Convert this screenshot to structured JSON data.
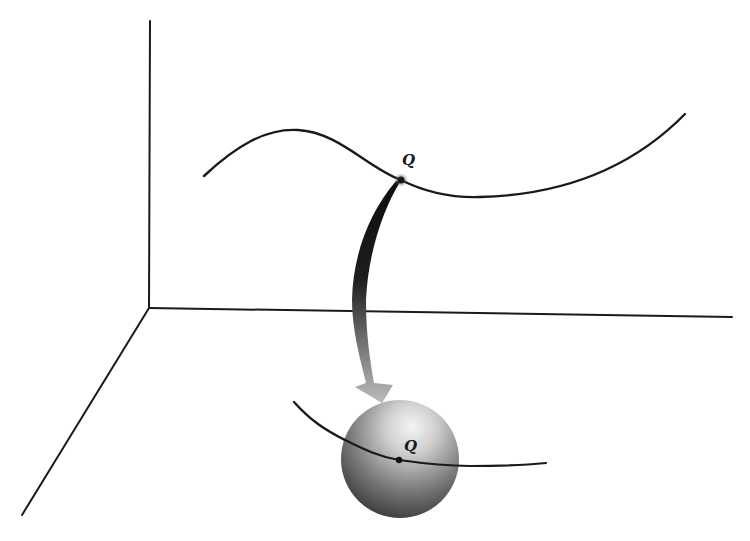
{
  "figure": {
    "type": "diagram",
    "colors": {
      "background": "#ffffff",
      "stroke": "#1a1a1a",
      "sphere_highlight": "#f2f2f2",
      "sphere_shadow": "#3a3a3a",
      "arrow_top": "#0d0d0d",
      "arrow_bottom": "#b8b8b8"
    },
    "axes": {
      "origin": [
        149,
        308
      ],
      "vertical_end": [
        150,
        21
      ],
      "horizontal_end": [
        732,
        317
      ],
      "diagonal_end": [
        22,
        515
      ]
    },
    "space_curve": {
      "point_label": "Q",
      "point": [
        401,
        180
      ]
    },
    "sphere": {
      "center": [
        400,
        459
      ],
      "radius": 59,
      "curve_point_label": "Q",
      "curve_point": [
        399,
        460
      ]
    },
    "labels": {
      "space_point": "Q",
      "sphere_point": "Q"
    }
  }
}
